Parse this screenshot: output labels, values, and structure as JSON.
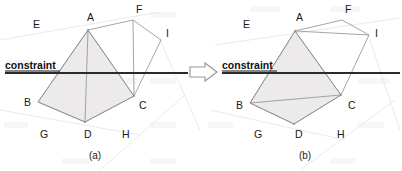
{
  "figure": {
    "title_caption_a": "(a)",
    "title_caption_b": "(b)",
    "constraint_label": "constraint",
    "colors": {
      "edge": "#8e8e8e",
      "polygon_fill": "#eceaea",
      "constraint_line": "#2b2b2b",
      "label_text": "#1a1a1a",
      "arrow_outline": "#9a9a9a",
      "background": "#ffffff"
    }
  },
  "panel_a": {
    "caption": "(a)",
    "constraint_label": "constraint",
    "constraint_line_y": 73,
    "vertex_labels": [
      {
        "id": "E",
        "label": "E",
        "lx": 33,
        "ly": 28
      },
      {
        "id": "A",
        "label": "A",
        "lx": 87,
        "ly": 21
      },
      {
        "id": "F",
        "label": "F",
        "lx": 136,
        "ly": 13
      },
      {
        "id": "I",
        "label": "I",
        "lx": 166,
        "ly": 37
      },
      {
        "id": "B",
        "label": "B",
        "lx": 24,
        "ly": 106
      },
      {
        "id": "C",
        "label": "C",
        "lx": 139,
        "ly": 109
      },
      {
        "id": "G",
        "label": "G",
        "lx": 40,
        "ly": 138
      },
      {
        "id": "D",
        "label": "D",
        "lx": 84,
        "ly": 138
      },
      {
        "id": "H",
        "label": "H",
        "lx": 122,
        "ly": 138
      }
    ],
    "vertices": {
      "A": [
        88,
        30
      ],
      "F": [
        133,
        20
      ],
      "I": [
        161,
        40
      ],
      "B": [
        38,
        102
      ],
      "C": [
        134,
        96
      ],
      "D": [
        85,
        122
      ]
    },
    "polygon_fill_points": "88,30 38,102 85,122 134,96",
    "edges": [
      [
        "A",
        "B"
      ],
      [
        "B",
        "D"
      ],
      [
        "D",
        "C"
      ],
      [
        "C",
        "A"
      ],
      [
        "A",
        "D"
      ],
      [
        "A",
        "F"
      ],
      [
        "F",
        "I"
      ],
      [
        "I",
        "C"
      ],
      [
        "F",
        "C"
      ]
    ]
  },
  "panel_b": {
    "caption": "(b)",
    "constraint_label": "constraint",
    "constraint_line_y": 73,
    "vertex_labels": [
      {
        "id": "E",
        "label": "E",
        "lx": 243,
        "ly": 28
      },
      {
        "id": "A",
        "label": "A",
        "lx": 296,
        "ly": 21
      },
      {
        "id": "F",
        "label": "F",
        "lx": 345,
        "ly": 13
      },
      {
        "id": "I",
        "label": "I",
        "lx": 375,
        "ly": 37
      },
      {
        "id": "B",
        "label": "B",
        "lx": 236,
        "ly": 109
      },
      {
        "id": "C",
        "label": "C",
        "lx": 348,
        "ly": 109
      },
      {
        "id": "G",
        "label": "G",
        "lx": 254,
        "ly": 138
      },
      {
        "id": "D",
        "label": "D",
        "lx": 295,
        "ly": 138
      },
      {
        "id": "H",
        "label": "H",
        "lx": 337,
        "ly": 138
      }
    ],
    "vertices": {
      "A": [
        295,
        31
      ],
      "F": [
        342,
        20
      ],
      "I": [
        369,
        35
      ],
      "B": [
        250,
        103
      ],
      "C": [
        341,
        95
      ],
      "D": [
        294,
        124
      ]
    },
    "polygon_fill_points": "295,31 250,103 294,124 341,95",
    "edges": [
      [
        "A",
        "B"
      ],
      [
        "B",
        "D"
      ],
      [
        "D",
        "C"
      ],
      [
        "C",
        "A"
      ],
      [
        "A",
        "F"
      ],
      [
        "F",
        "I"
      ],
      [
        "I",
        "C"
      ],
      [
        "A",
        "I"
      ]
    ]
  },
  "transition_arrow": {
    "name": "transition-arrow",
    "direction": "right",
    "points": "190,67 205,67 205,63 217,72 205,81 205,77 190,77"
  }
}
